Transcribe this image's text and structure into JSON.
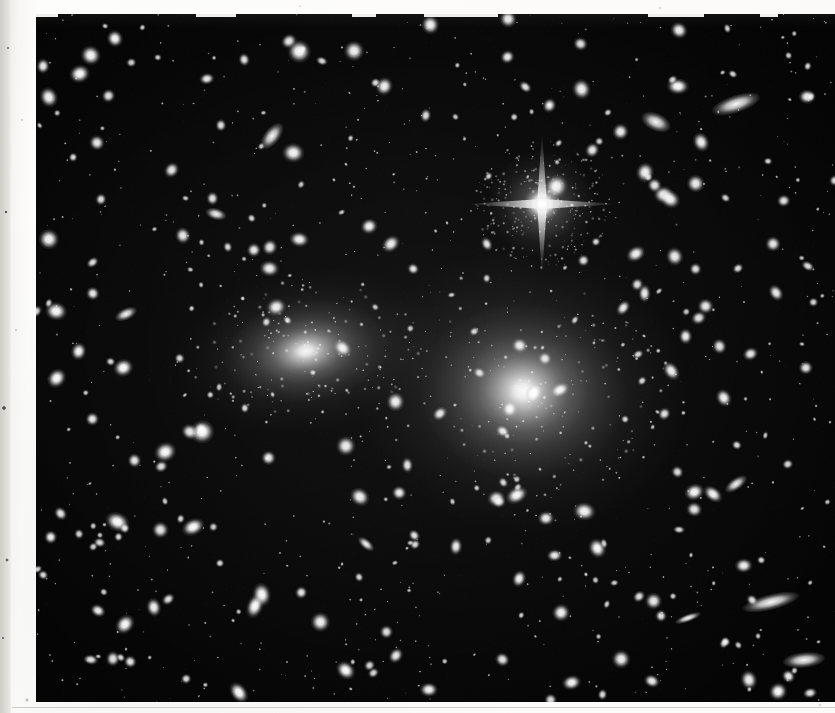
{
  "image": {
    "kind": "astronomical-photographic-plate-scan",
    "subject": "galaxy cluster field",
    "width": 835,
    "height": 713,
    "margin_color": "#f7f6f4",
    "edge_strip_color": "#d6d4d0",
    "sky_color": "#050505",
    "source_color": "#ffffff",
    "plate": {
      "x": 36,
      "y": 14,
      "width": 799,
      "height": 688
    }
  },
  "scan_artifacts": {
    "left_strip": {
      "x": 0,
      "y": 0,
      "width": 11,
      "height": 713
    },
    "rules": [
      {
        "y": 707
      }
    ],
    "top_nicks": [
      {
        "x": 36,
        "width": 22
      },
      {
        "x": 196,
        "width": 40
      },
      {
        "x": 352,
        "width": 24
      },
      {
        "x": 424,
        "width": 74
      },
      {
        "x": 648,
        "width": 56
      },
      {
        "x": 760,
        "width": 18
      }
    ]
  },
  "chart_data": {
    "type": "scatter",
    "title": "",
    "xlabel": "",
    "ylabel": "",
    "grid": false,
    "legend": "none",
    "xlim": [
      0,
      799
    ],
    "ylim": [
      0,
      688
    ],
    "note": "Sky positions are plate pixel coordinates relative to the plate origin; size is the apparent diameter in pixels; brightness is 0-1 relative peak intensity.",
    "extended_sources": [
      {
        "name": "cD-galaxy-west",
        "x": 270,
        "y": 337,
        "rx": 62,
        "ry": 38,
        "angle": -8,
        "brightness": 0.95,
        "type": "elliptical-galaxy"
      },
      {
        "name": "cD-galaxy-east",
        "x": 487,
        "y": 377,
        "rx": 78,
        "ry": 66,
        "angle": 5,
        "brightness": 1.0,
        "type": "elliptical-galaxy"
      }
    ],
    "bright_star": {
      "name": "foreground-star",
      "x": 506,
      "y": 190,
      "core": 16,
      "spike_length": 72,
      "brightness": 1.0,
      "type": "star-with-diffraction-spikes"
    },
    "edge_on_galaxies": [
      {
        "x": 700,
        "y": 90,
        "rx": 26,
        "ry": 9,
        "angle": -18
      },
      {
        "x": 236,
        "y": 122,
        "rx": 16,
        "ry": 8,
        "angle": -52
      },
      {
        "x": 620,
        "y": 108,
        "rx": 16,
        "ry": 9,
        "angle": 25
      },
      {
        "x": 735,
        "y": 588,
        "rx": 30,
        "ry": 8,
        "angle": -14
      },
      {
        "x": 652,
        "y": 604,
        "rx": 14,
        "ry": 4,
        "angle": -20
      },
      {
        "x": 768,
        "y": 646,
        "rx": 22,
        "ry": 8,
        "angle": -6
      },
      {
        "x": 330,
        "y": 530,
        "rx": 10,
        "ry": 5,
        "angle": 40
      },
      {
        "x": 90,
        "y": 300,
        "rx": 12,
        "ry": 6,
        "angle": -25
      },
      {
        "x": 180,
        "y": 200,
        "rx": 11,
        "ry": 6,
        "angle": 15
      },
      {
        "x": 700,
        "y": 470,
        "rx": 13,
        "ry": 6,
        "angle": -35
      }
    ],
    "seed": 20240517,
    "star_count": 560,
    "size_range": [
      1.2,
      11
    ],
    "cluster_halo_star_count": 150
  }
}
